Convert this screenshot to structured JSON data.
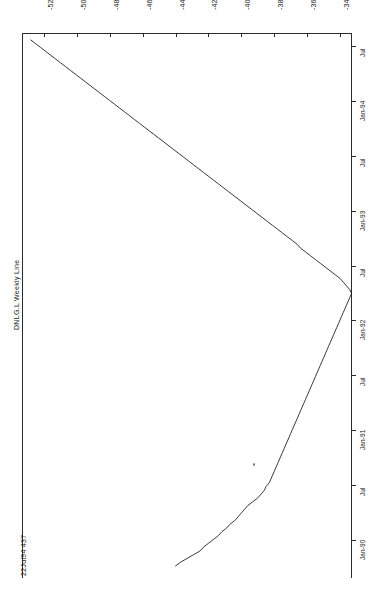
{
  "chart_data": {
    "type": "line",
    "title": "DNLG.L Weekly Line",
    "orientation": "rotated-90",
    "xlabel": "",
    "ylabel": "",
    "grid": false,
    "legend": null,
    "price_axis": {
      "position": "top",
      "ticks": [
        -520,
        -500,
        -480,
        -460,
        -440,
        -420,
        -400,
        -380,
        -360,
        -340
      ],
      "tick_labels": [
        "-520",
        "-500",
        "-480",
        "-460",
        "-440",
        "-420",
        "-400",
        "-380",
        "-360",
        "-340"
      ],
      "range": [
        -530,
        -332
      ]
    },
    "time_axis": {
      "position": "right",
      "tick_labels": [
        "Jul",
        "Jan-94",
        "Jul",
        "Jan-93",
        "Jul",
        "Jan-92",
        "Jul",
        "Jan-91",
        "Jul",
        "Jan-90"
      ],
      "range": [
        "Jan-90",
        "Jul-94"
      ]
    },
    "annotation": {
      "date": "22Jul94",
      "value": "437",
      "text": "22Jul94 437"
    },
    "series": [
      {
        "name": "DNLG.L Weekly Line",
        "color": "#222222",
        "x": [
          -440,
          -437,
          -433,
          -429,
          -425,
          -423,
          -420,
          -417,
          -414,
          -412,
          -409,
          -407,
          -404,
          -402,
          -400,
          -398,
          -396,
          -393,
          -390,
          -388,
          -386,
          -385,
          -383,
          -382,
          -381,
          -380,
          -379,
          -378,
          -377,
          -376,
          -375,
          -374,
          -373,
          -372,
          -371,
          -370,
          -369,
          -368,
          -367,
          -366,
          -365,
          -364,
          -363,
          -362,
          -361,
          -360,
          -359,
          -358,
          -357,
          -356,
          -355,
          -354,
          -353,
          -352,
          -351,
          -350,
          -349,
          -348,
          -347,
          -346,
          -345,
          -344,
          -343,
          -342,
          -341,
          -340,
          -339,
          -338,
          -337,
          -336,
          -335,
          -334,
          -333,
          -334,
          -336,
          -338,
          -340,
          -343,
          -346,
          -349,
          -352,
          -355,
          -358,
          -361,
          -364,
          -366,
          -369,
          -372,
          -375,
          -378,
          -381,
          -384,
          -387,
          -390,
          -393,
          -396,
          -399,
          -402,
          -405,
          -408,
          -411,
          -414,
          -417,
          -420,
          -423,
          -426,
          -429,
          -432,
          -435,
          -438,
          -441,
          -444,
          -447,
          -450,
          -453,
          -456,
          -459,
          -462,
          -465,
          -468,
          -471,
          -474,
          -477,
          -480,
          -483,
          -486,
          -489,
          -492,
          -495,
          -498,
          -501,
          -504,
          -507,
          -510,
          -513,
          -516,
          -519,
          -522,
          -525,
          -528
        ],
        "y_labels": [
          "Jan-90",
          "Jul-90",
          "Jan-91",
          "Jul-91",
          "Jan-92",
          "Jul-92",
          "Jan-93",
          "Jul-93",
          "Jan-94",
          "Jul-94"
        ],
        "description": "Weekly closing price line rising from approx -440 at Jan-90 through a trough near -333 around Jan-92 then declining to approx -528 by Jul-94"
      }
    ]
  },
  "labels": {
    "series_label": "DNLG.L Weekly Line",
    "corner_label": "22Jul94 437"
  }
}
